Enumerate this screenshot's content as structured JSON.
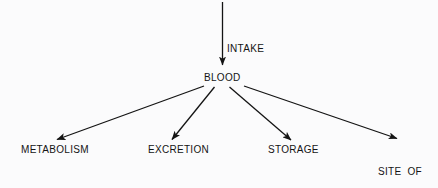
{
  "diagram": {
    "background_color": "#fbfbfc",
    "stroke_color": "#141414",
    "text_color": "#141414",
    "nodes": {
      "blood": "BLOOD",
      "metabolism": "METABOLISM",
      "excretion": "EXCRETION",
      "storage": "STORAGE",
      "site_of_action_line1": "SITE  OF",
      "site_of_action_line2": "ACTION"
    },
    "edges": {
      "intake_label": "INTAKE"
    }
  }
}
